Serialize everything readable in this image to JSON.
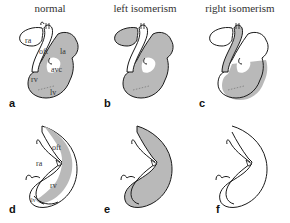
{
  "columns": [
    {
      "title": "normal"
    },
    {
      "title": "left isomerism"
    },
    {
      "title": "right isomerism"
    }
  ],
  "panels": [
    {
      "letter": "a",
      "labels": {
        "ra": "ra",
        "oft": "oft",
        "la": "la",
        "avc": "avc",
        "rv": "rv",
        "lv": "lv"
      }
    },
    {
      "letter": "b"
    },
    {
      "letter": "c"
    },
    {
      "letter": "d",
      "labels": {
        "oft": "oft",
        "ra": "ra",
        "rv": "rv",
        "lv": "lv"
      }
    },
    {
      "letter": "e"
    },
    {
      "letter": "f"
    }
  ],
  "colors": {
    "fill_gray": "#b9b9b9",
    "outline": "#1a1a1a",
    "background": "#ffffff"
  }
}
